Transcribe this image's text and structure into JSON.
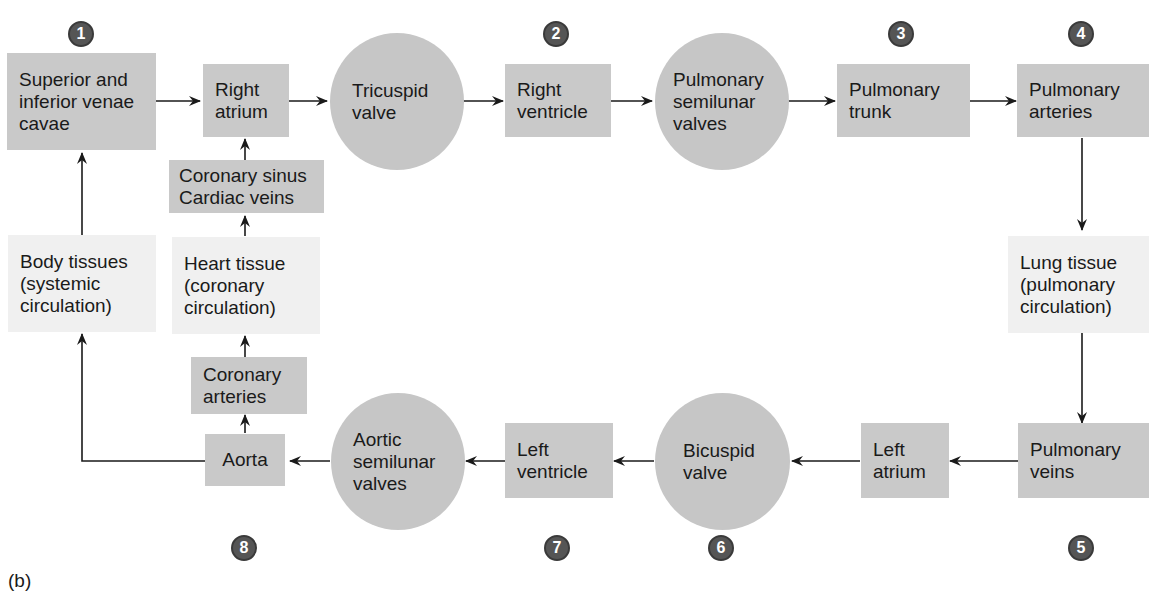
{
  "figure_label": "(b)",
  "nodes": {
    "venae_cavae": "Superior and inferior venae cavae",
    "right_atrium": "Right atrium",
    "tricuspid_valve": "Tricuspid valve",
    "right_ventricle": "Right ventricle",
    "pulmonary_semilunar_valves": "Pulmonary semilunar valves",
    "pulmonary_trunk": "Pulmonary trunk",
    "pulmonary_arteries": "Pulmonary arteries",
    "lung_tissue": "Lung tissue (pulmonary circulation)",
    "pulmonary_veins": "Pulmonary veins",
    "left_atrium": "Left atrium",
    "bicuspid_valve": "Bicuspid valve",
    "left_ventricle": "Left ventricle",
    "aortic_semilunar_valves": "Aortic semilunar valves",
    "aorta": "Aorta",
    "coronary_arteries": "Coronary arteries",
    "heart_tissue": "Heart tissue (coronary circulation)",
    "coronary_sinus": "Coronary sinus Cardiac veins",
    "body_tissues": "Body tissues (systemic circulation)"
  },
  "step_numbers": {
    "s1": "1",
    "s2": "2",
    "s3": "3",
    "s4": "4",
    "s5": "5",
    "s6": "6",
    "s7": "7",
    "s8": "8"
  },
  "colors": {
    "chamber_fill": "#c9c9c9",
    "valve_fill": "#c6c6c6",
    "tissue_fill": "#f0f0f0",
    "badge_fill": "#555555"
  }
}
